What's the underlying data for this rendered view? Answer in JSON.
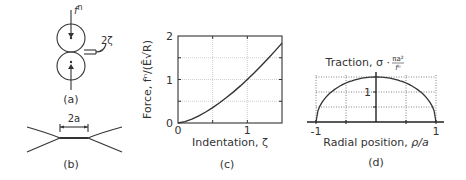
{
  "figure": {
    "panel_a": {
      "label": "(a)",
      "force_label": "f",
      "force_sup": "n",
      "gap_label": "2ζ",
      "colors": {
        "stroke": "#333333"
      }
    },
    "panel_b": {
      "label": "(b)",
      "contact_label": "2a"
    },
    "panel_c": {
      "label": "(c)"
    },
    "panel_d": {
      "label": "(d)"
    }
  },
  "chart_data": [
    {
      "panel": "(c)",
      "type": "line",
      "title": "",
      "xlabel": "Indentation, ζ",
      "ylabel": "Force, fⁿ/(Ē√R)",
      "xlim": [
        0,
        1.5
      ],
      "ylim": [
        0,
        2
      ],
      "x_ticks": [
        "0",
        "1"
      ],
      "y_ticks": [
        "0",
        "1",
        "2"
      ],
      "grid": true,
      "series": [
        {
          "name": "Hertz force",
          "x": [
            0,
            0.1,
            0.2,
            0.3,
            0.4,
            0.5,
            0.6,
            0.7,
            0.8,
            0.9,
            1.0,
            1.1,
            1.2,
            1.3,
            1.4,
            1.5
          ],
          "values": [
            0,
            0.032,
            0.089,
            0.164,
            0.253,
            0.354,
            0.465,
            0.586,
            0.716,
            0.854,
            1.0,
            1.154,
            1.315,
            1.482,
            1.657,
            1.837
          ]
        }
      ]
    },
    {
      "panel": "(d)",
      "type": "line",
      "title": "",
      "xlabel": "Radial position, ρ/a",
      "ylabel": "Traction, σ · πa²/fⁿ",
      "xlim": [
        -1,
        1
      ],
      "ylim": [
        0,
        1.5
      ],
      "x_ticks": [
        "-1",
        "1"
      ],
      "y_ticks": [
        "1"
      ],
      "grid": true,
      "series": [
        {
          "name": "Hertz pressure distribution",
          "x": [
            -1,
            -0.9,
            -0.8,
            -0.6,
            -0.4,
            -0.2,
            0,
            0.2,
            0.4,
            0.6,
            0.8,
            0.9,
            1
          ],
          "values": [
            0,
            0.654,
            0.9,
            1.2,
            1.375,
            1.47,
            1.5,
            1.47,
            1.375,
            1.2,
            0.9,
            0.654,
            0
          ]
        }
      ]
    }
  ]
}
